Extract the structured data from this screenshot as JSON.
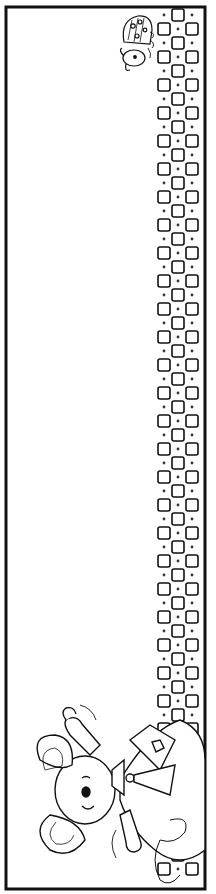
{
  "page": {
    "type": "coloring-page-border",
    "orientation": "portrait",
    "colors": {
      "ink": "#111111",
      "paper": "#ffffff"
    }
  },
  "frame": {
    "x": 5,
    "y": 6,
    "width": 201,
    "height": 884,
    "stroke_width": 3
  },
  "checker_strip": {
    "columns": 3,
    "x": 157,
    "cell_size": 14,
    "top": 8,
    "bottom": 888,
    "pattern": "alternating-outlined-squares-with-dots"
  },
  "decorations": [
    {
      "name": "ladybug",
      "position": "top-right",
      "x": 122,
      "y": 12
    },
    {
      "name": "koala",
      "position": "bottom-left",
      "x": 20,
      "y": 700
    }
  ]
}
